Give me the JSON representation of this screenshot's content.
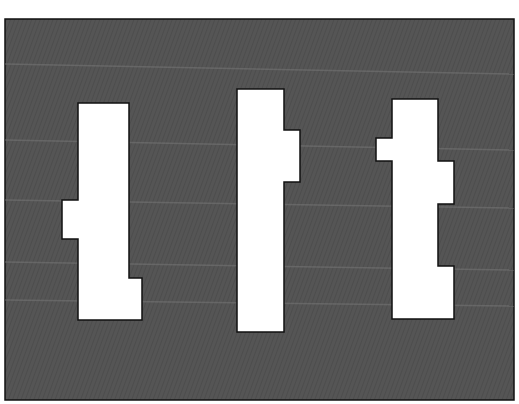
{
  "scene": {
    "background_color": "#ffffff",
    "panel": {
      "x": 5,
      "y": 19,
      "width": 509,
      "height": 381,
      "fill": "#555555",
      "stroke": "#111111",
      "texture": "diagonal-hatch",
      "streak_color": "#7a7a7a"
    },
    "shapes": [
      {
        "name": "block-left",
        "fill": "#ffffff",
        "stroke": "#111111",
        "points": "78,103 129,103 129,278 142,278 142,320 78,320 78,239 62,239 62,200 78,200"
      },
      {
        "name": "block-middle",
        "fill": "#ffffff",
        "stroke": "#111111",
        "points": "237,89 284,89 284,130 300,130 300,182 284,182 284,332 237,332"
      },
      {
        "name": "block-right",
        "fill": "#ffffff",
        "stroke": "#111111",
        "points": "392,99 438,99 438,161 454,161 454,204 438,204 438,266 454,266 454,319 392,319 392,161 376,161 376,138 392,138"
      }
    ],
    "streaks": [
      {
        "y1": 64,
        "y2": 74
      },
      {
        "y1": 140,
        "y2": 150
      },
      {
        "y1": 200,
        "y2": 208
      },
      {
        "y1": 262,
        "y2": 270
      },
      {
        "y1": 300,
        "y2": 306
      }
    ]
  }
}
